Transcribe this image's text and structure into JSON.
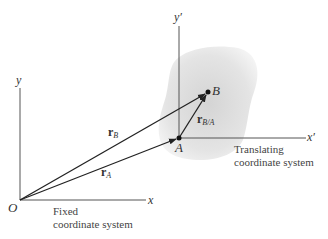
{
  "diagram": {
    "fixed_frame": {
      "origin_label": "O",
      "x_axis_label": "x",
      "y_axis_label": "y",
      "caption_line1": "Fixed",
      "caption_line2": "coordinate system"
    },
    "translating_frame": {
      "x_axis_label": "x′",
      "y_axis_label": "y′",
      "caption_line1": "Translating",
      "caption_line2": "coordinate system"
    },
    "points": {
      "A": "A",
      "B": "B"
    },
    "vectors": {
      "rA": {
        "symbol": "r",
        "subscript": "A"
      },
      "rB": {
        "symbol": "r",
        "subscript": "B"
      },
      "rBA": {
        "symbol": "r",
        "subscript": "B/A"
      }
    },
    "colors": {
      "line": "#222222",
      "axis": "#555555",
      "body_fill": "#e6e6e6"
    }
  }
}
